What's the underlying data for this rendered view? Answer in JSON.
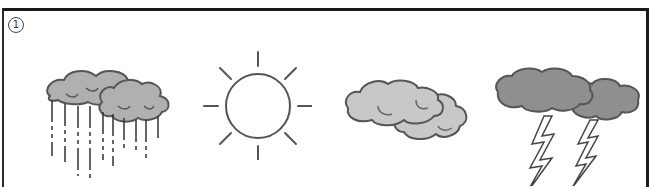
{
  "question": {
    "number_label": "1",
    "options": [
      {
        "id": "rain",
        "icon": "rain-cloud-icon",
        "label": "rain"
      },
      {
        "id": "sunny",
        "icon": "sun-icon",
        "label": "sunny"
      },
      {
        "id": "cloudy",
        "icon": "cloud-icon",
        "label": "cloudy"
      },
      {
        "id": "thunderstorm",
        "icon": "thunderstorm-icon",
        "label": "thunderstorm"
      }
    ]
  },
  "colors": {
    "cloud_fill_light": "#c6c6c6",
    "cloud_fill_mid": "#a9a9a9",
    "cloud_fill_dark": "#8e8e8e",
    "stroke": "#555555",
    "border": "#1a1a1a"
  }
}
